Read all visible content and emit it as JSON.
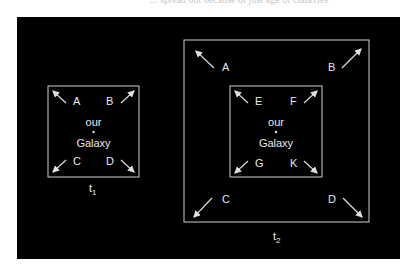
{
  "caption_fragment": "... spread out because of just age of Galaxies",
  "diagram": {
    "t1": {
      "time_label": "t",
      "time_sub": "1",
      "center_top": "our",
      "center_bottom": "Galaxy",
      "galaxies": [
        "A",
        "B",
        "C",
        "D"
      ]
    },
    "t2": {
      "time_label": "t",
      "time_sub": "2",
      "center_top": "our",
      "center_bottom": "Galaxy",
      "outer_galaxies": [
        "A",
        "B",
        "C",
        "D"
      ],
      "inner_galaxies": [
        "E",
        "F",
        "G",
        "K"
      ]
    },
    "colors": {
      "background": "#000000",
      "lines": "#cfcfcf",
      "text": "#e8e8e8"
    }
  }
}
